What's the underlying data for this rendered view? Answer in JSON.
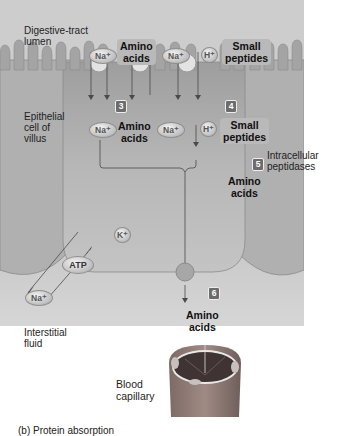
{
  "diagram": {
    "title_regions": {
      "lumen": "Digestive-tract lumen",
      "epithelial": "Epithelial cell of villus",
      "interstitial": "Interstitial fluid",
      "capillary": "Blood capillary",
      "peptidases": "Intracellular peptidases"
    },
    "lumen_labels": {
      "lumen_line1": "Digestive-tract",
      "lumen_line2": "lumen",
      "amino_line1": "Amino",
      "amino_line2": "acids",
      "small_line1": "Small",
      "small_line2": "peptides"
    },
    "cell_labels": {
      "epi_line1": "Epithelial",
      "epi_line2": "cell of",
      "epi_line3": "villus",
      "amino_line1": "Amino",
      "amino_line2": "acids",
      "small_line1": "Small",
      "small_line2": "peptides",
      "intracellular_line1": "Intracellular",
      "intracellular_line2": "peptidases",
      "amino5_line1": "Amino",
      "amino5_line2": "acids"
    },
    "lower_labels": {
      "interstitial_line1": "Interstitial",
      "interstitial_line2": "fluid",
      "amino_line1": "Amino",
      "amino_line2": "acids",
      "blood_line1": "Blood",
      "blood_line2": "capillary"
    },
    "ions": {
      "na": "Na⁺",
      "h": "H⁺",
      "k": "K⁺",
      "atp": "ATP"
    },
    "steps": [
      "3",
      "4",
      "5",
      "6",
      "7"
    ],
    "caption": "(b) Protein absorption",
    "colors": {
      "panel": "#cdcdcd",
      "cell": "#b4b4b4",
      "label_box": "#b9b9b9",
      "step_badge": "#6c6c6c",
      "capillary": "#8a7570"
    }
  }
}
